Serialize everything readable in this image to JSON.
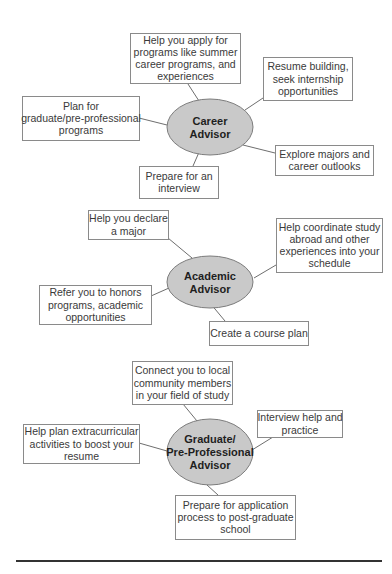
{
  "diagrams": [
    {
      "hub": [
        "Career",
        "Advisor"
      ],
      "items": [
        [
          "Help you apply for",
          "programs like summer",
          "career programs, and",
          "experiences"
        ],
        [
          "Resume building,",
          "seek internship",
          "opportunities"
        ],
        [
          "Plan for",
          "graduate/pre-professional",
          "programs"
        ],
        [
          "Explore majors and",
          "career outlooks"
        ],
        [
          "Prepare for an",
          "interview"
        ]
      ]
    },
    {
      "hub": [
        "Academic",
        "Advisor"
      ],
      "items": [
        [
          "Help you declare",
          "a major"
        ],
        [
          "Help coordinate study",
          "abroad and other",
          "experiences into your",
          "schedule"
        ],
        [
          "Refer you to honors",
          "programs, academic",
          "opportunities"
        ],
        [
          "Create a course plan"
        ]
      ]
    },
    {
      "hub": [
        "Graduate/",
        "Pre-Professional",
        "Advisor"
      ],
      "items": [
        [
          "Connect you to local",
          "community members",
          "in your field of study"
        ],
        [
          "Interview help and",
          "practice"
        ],
        [
          "Help plan extracurricular",
          "activities to boost your",
          "resume"
        ],
        [
          "Prepare for application",
          "process to post-graduate",
          "school"
        ]
      ]
    }
  ],
  "colors": {
    "hub_fill": "#c9c9c9",
    "box_border": "#8a8a8a",
    "text": "#3a3a3a"
  }
}
